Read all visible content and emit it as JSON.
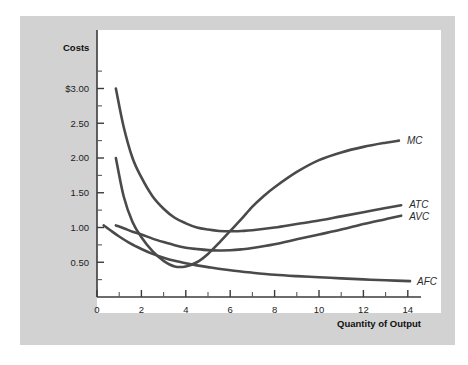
{
  "figure": {
    "card_bg": "#d2d2d2",
    "plot_bg": "#ffffff",
    "curve_color": "#4a4a4a",
    "axis_color": "#3b3b3b"
  },
  "chart_data": {
    "type": "line",
    "title": "",
    "ylabel": "Costs",
    "xlabel": "Quantity of Output",
    "xlim": [
      0,
      15.5
    ],
    "ylim": [
      0,
      3.3
    ],
    "grid": false,
    "legend_position": "right-inline-labels",
    "ytick_labels": [
      "$3.00",
      "2.50",
      "2.00",
      "1.50",
      "1.00",
      "0.50"
    ],
    "ytick_values": [
      3.0,
      2.5,
      2.0,
      1.5,
      1.0,
      0.5
    ],
    "yminor_values": [
      3.25,
      2.75,
      2.25,
      1.75,
      1.25,
      0.75,
      0.25
    ],
    "xtick_labels": [
      "0",
      "2",
      "4",
      "6",
      "8",
      "10",
      "12",
      "14"
    ],
    "xtick_values": [
      0,
      2,
      4,
      6,
      8,
      10,
      12,
      14
    ],
    "xminor_values": [
      1,
      3,
      5,
      7,
      9,
      11,
      13,
      15
    ],
    "series": [
      {
        "name": "MC",
        "label": "MC",
        "x": [
          0.85,
          1.2,
          1.6,
          2.0,
          2.5,
          3.0,
          3.5,
          4.0,
          4.5,
          5.0,
          5.5,
          6.0,
          6.5,
          7.0,
          7.5,
          8.0,
          9.0,
          10.0,
          11.0,
          12.0,
          13.0,
          13.6
        ],
        "y": [
          2.0,
          1.45,
          1.08,
          0.86,
          0.66,
          0.52,
          0.44,
          0.44,
          0.5,
          0.62,
          0.78,
          0.95,
          1.12,
          1.3,
          1.45,
          1.58,
          1.8,
          1.97,
          2.08,
          2.16,
          2.22,
          2.25
        ]
      },
      {
        "name": "ATC",
        "label": "ATC",
        "x": [
          0.85,
          1.2,
          1.6,
          2.0,
          2.5,
          3.0,
          3.5,
          4.0,
          4.5,
          5.0,
          5.5,
          6.0,
          6.5,
          7.0,
          8.0,
          9.0,
          10.0,
          11.0,
          12.0,
          13.0,
          13.7
        ],
        "y": [
          3.0,
          2.45,
          2.0,
          1.72,
          1.45,
          1.27,
          1.14,
          1.06,
          1.0,
          0.97,
          0.95,
          0.945,
          0.95,
          0.96,
          1.0,
          1.05,
          1.1,
          1.16,
          1.22,
          1.28,
          1.32
        ]
      },
      {
        "name": "AVC",
        "label": "AVC",
        "x": [
          0.85,
          1.2,
          1.6,
          2.0,
          2.5,
          3.0,
          3.5,
          4.0,
          4.5,
          5.0,
          5.5,
          6.0,
          6.5,
          7.0,
          8.0,
          9.0,
          10.0,
          11.0,
          12.0,
          13.0,
          13.7
        ],
        "y": [
          1.03,
          0.99,
          0.94,
          0.9,
          0.84,
          0.79,
          0.745,
          0.71,
          0.69,
          0.675,
          0.67,
          0.672,
          0.685,
          0.705,
          0.76,
          0.83,
          0.9,
          0.97,
          1.05,
          1.12,
          1.17
        ]
      },
      {
        "name": "AFC",
        "label": "AFC",
        "x": [
          0.3,
          0.6,
          1.0,
          1.5,
          2.0,
          2.5,
          3.0,
          3.5,
          4.0,
          4.5,
          5.0,
          6.0,
          7.0,
          8.0,
          9.0,
          10.0,
          11.0,
          12.0,
          13.0,
          14.1
        ],
        "y": [
          1.03,
          0.96,
          0.87,
          0.77,
          0.69,
          0.62,
          0.565,
          0.52,
          0.485,
          0.455,
          0.43,
          0.385,
          0.35,
          0.32,
          0.3,
          0.285,
          0.268,
          0.253,
          0.24,
          0.228
        ]
      }
    ]
  }
}
